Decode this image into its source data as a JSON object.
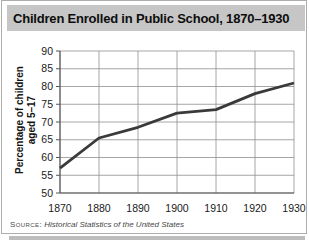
{
  "title": "Children Enrolled in Public School, 1870–1930",
  "source": {
    "prefix": "Source:",
    "text": "Historical Statistics of the United States"
  },
  "colors": {
    "title_bar_bg": "#c6c6c6",
    "shadow": "#bdbdbd",
    "line": "#3a3a3a",
    "grid": "#8f8f8f",
    "axis": "#555555",
    "tick_text": "#1a1a1a"
  },
  "chart_data": {
    "type": "line",
    "title": "Children Enrolled in Public School, 1870–1930",
    "x": [
      1870,
      1880,
      1890,
      1900,
      1910,
      1920,
      1930
    ],
    "values": [
      57,
      65.5,
      68.5,
      72.5,
      73.5,
      78,
      81
    ],
    "xlabel": "",
    "ylabel": "Percentage of children aged 5–17",
    "ylabel_lines": [
      "Percentage of children",
      "aged 5–17"
    ],
    "xlim": [
      1870,
      1930
    ],
    "ylim": [
      50,
      90
    ],
    "xticks": [
      1870,
      1880,
      1890,
      1900,
      1910,
      1920,
      1930
    ],
    "yticks": [
      50,
      55,
      60,
      65,
      70,
      75,
      80,
      85,
      90
    ],
    "grid": true,
    "legend": "none"
  }
}
